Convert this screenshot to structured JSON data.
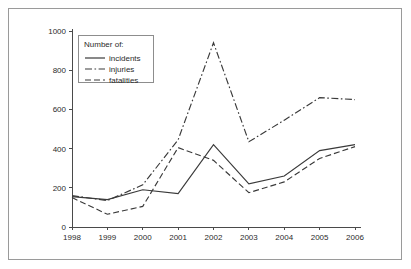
{
  "figure": {
    "border_color": "#9a9a9a",
    "background": "#ffffff",
    "line_color": "#3a3a3a"
  },
  "legend": {
    "title": "Number of:",
    "position": "top-left-inside",
    "entries": [
      {
        "label": "incidents",
        "style": "solid"
      },
      {
        "label": "injuries",
        "style": "dash-dot"
      },
      {
        "label": "fatalities",
        "style": "dashed"
      }
    ]
  },
  "chart_data": {
    "type": "line",
    "title": "",
    "xlabel": "",
    "ylabel": "",
    "categories": [
      "1998",
      "1999",
      "2000",
      "2001",
      "2002",
      "2003",
      "2004",
      "2005",
      "2006"
    ],
    "x": [
      1998,
      1999,
      2000,
      2001,
      2002,
      2003,
      2004,
      2005,
      2006
    ],
    "xlim": [
      1998,
      2006
    ],
    "ylim": [
      0,
      1000
    ],
    "yticks": [
      0,
      200,
      400,
      600,
      800,
      1000
    ],
    "ytick_labels": [
      "0",
      "200",
      "400",
      "600",
      "800",
      "1000"
    ],
    "xtick_labels": [
      "1998",
      "1999",
      "2000",
      "2001",
      "2002",
      "2003",
      "2004",
      "2005",
      "2006"
    ],
    "grid": false,
    "legend_position": "upper left",
    "series": [
      {
        "name": "incidents",
        "style": "solid",
        "color": "#3a3a3a",
        "values": [
          155,
          140,
          190,
          170,
          420,
          220,
          260,
          390,
          420
        ]
      },
      {
        "name": "injuries",
        "style": "dash-dot",
        "color": "#3a3a3a",
        "values": [
          160,
          135,
          215,
          445,
          940,
          435,
          545,
          660,
          650
        ]
      },
      {
        "name": "fatalities",
        "style": "dashed",
        "color": "#3a3a3a",
        "values": [
          150,
          65,
          105,
          405,
          340,
          175,
          230,
          350,
          410
        ]
      }
    ]
  }
}
